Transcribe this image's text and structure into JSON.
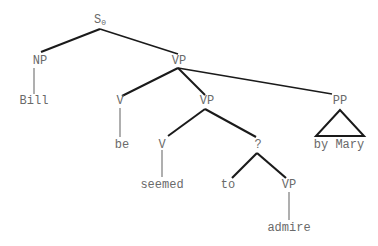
{
  "diagram": {
    "type": "syntax-tree",
    "nodes": {
      "s0": {
        "label": "S",
        "subscript": "0"
      },
      "np": {
        "label": "NP"
      },
      "vp_top": {
        "label": "VP"
      },
      "bill": {
        "label": "Bill"
      },
      "v_be": {
        "label": "V"
      },
      "vp_mid": {
        "label": "VP"
      },
      "pp": {
        "label": "PP"
      },
      "be": {
        "label": "be"
      },
      "v_seemed": {
        "label": "V"
      },
      "q": {
        "label": "?"
      },
      "by_mary": {
        "label": "by Mary"
      },
      "seemed": {
        "label": "seemed"
      },
      "to": {
        "label": "to"
      },
      "vp_low": {
        "label": "VP"
      },
      "admire": {
        "label": "admire"
      }
    },
    "edges": [
      [
        "s0",
        "np"
      ],
      [
        "s0",
        "vp_top"
      ],
      [
        "np",
        "bill"
      ],
      [
        "vp_top",
        "v_be"
      ],
      [
        "vp_top",
        "vp_mid"
      ],
      [
        "vp_top",
        "pp"
      ],
      [
        "v_be",
        "be"
      ],
      [
        "vp_mid",
        "v_seemed"
      ],
      [
        "vp_mid",
        "q"
      ],
      [
        "pp",
        "by_mary"
      ],
      [
        "v_seemed",
        "seemed"
      ],
      [
        "q",
        "to"
      ],
      [
        "q",
        "vp_low"
      ],
      [
        "vp_low",
        "admire"
      ]
    ],
    "colors": {
      "edge": "#1a1a1a",
      "label": "#6a6a6a"
    }
  }
}
